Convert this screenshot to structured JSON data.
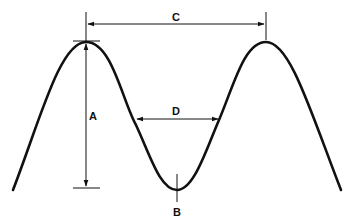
{
  "diagram": {
    "type": "wave-dimension-diagram",
    "labels": {
      "amplitude": "A",
      "trough": "B",
      "wavelength": "C",
      "width": "D"
    },
    "colors": {
      "stroke": "#111111",
      "background": "#ffffff"
    }
  }
}
